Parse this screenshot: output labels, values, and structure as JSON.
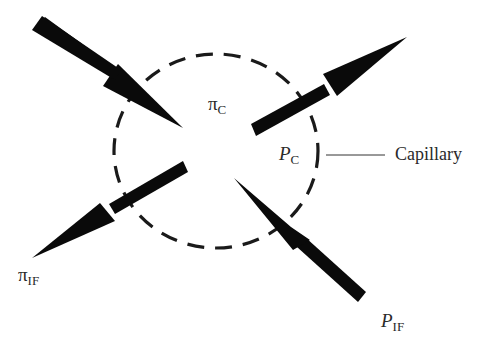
{
  "diagram": {
    "type": "starling-forces",
    "labels": {
      "pi_c": {
        "symbol": "π",
        "subscript": "C"
      },
      "p_c": {
        "symbol": "P",
        "subscript": "C"
      },
      "pi_if": {
        "symbol": "π",
        "subscript": "IF"
      },
      "p_if": {
        "symbol": "P",
        "subscript": "IF"
      },
      "capillary": "Capillary"
    },
    "colors": {
      "arrow": "#0a0a0a",
      "circle": "#1a1a1a",
      "text": "#2a2a2a"
    }
  }
}
